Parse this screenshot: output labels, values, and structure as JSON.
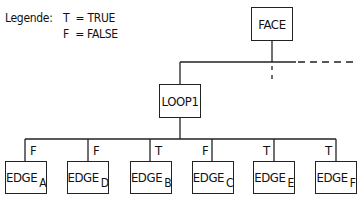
{
  "legend": {
    "label": "Legende:",
    "entries": [
      {
        "key": "T",
        "eq": "=",
        "value": "TRUE"
      },
      {
        "key": "F",
        "eq": "=",
        "value": "FALSE"
      }
    ]
  },
  "nodes": {
    "face": {
      "label": "FACE"
    },
    "loop": {
      "label": "LOOP1"
    },
    "edges": [
      {
        "label": "EDGE",
        "sub": "A",
        "flag": "F"
      },
      {
        "label": "EDGE",
        "sub": "D",
        "flag": "F"
      },
      {
        "label": "EDGE",
        "sub": "B",
        "flag": "T"
      },
      {
        "label": "EDGE",
        "sub": "C",
        "flag": "F"
      },
      {
        "label": "EDGE",
        "sub": "E",
        "flag": "T"
      },
      {
        "label": "EDGE",
        "sub": "F",
        "flag": "T"
      }
    ]
  }
}
